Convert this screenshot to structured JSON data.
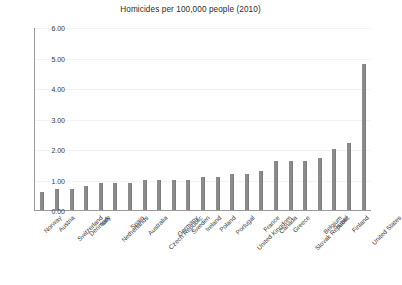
{
  "chart_data": {
    "type": "bar",
    "title": "Homicides per 100,000 people (2010)",
    "xlabel": "",
    "ylabel": "",
    "ylim": [
      0,
      6
    ],
    "yticks": [
      0,
      1,
      2,
      3,
      4,
      5,
      6
    ],
    "ytick_labels": [
      "0.00",
      "1.00",
      "2.00",
      "3.00",
      "4.00",
      "5.00",
      "6.00"
    ],
    "grid": true,
    "legend": false,
    "bar_color": "#8b8b8b",
    "categories": [
      "Norway",
      "Austria",
      "Switzerland",
      "Denmark",
      "Italy",
      "Netherlands",
      "Spain",
      "Australia",
      "Czech Republic",
      "Germany",
      "Sweden",
      "Ireland",
      "Poland",
      "Portugal",
      "United Kingdom",
      "France",
      "Canada",
      "Greece",
      "Slovak Republic",
      "Belgium",
      "Israel",
      "Finland",
      "United States"
    ],
    "values": [
      0.6,
      0.7,
      0.7,
      0.8,
      0.9,
      0.9,
      0.9,
      1.0,
      1.0,
      1.0,
      1.0,
      1.1,
      1.1,
      1.2,
      1.2,
      1.3,
      1.6,
      1.6,
      1.6,
      1.7,
      2.0,
      2.2,
      4.8
    ]
  }
}
